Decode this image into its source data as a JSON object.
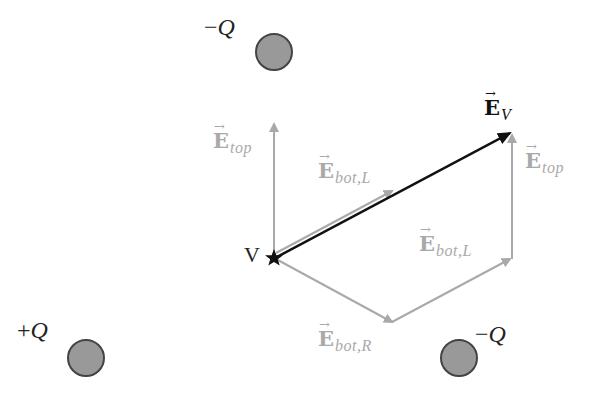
{
  "diagram": {
    "colors": {
      "charge_fill": "#999999",
      "charge_stroke": "#444444",
      "component_vector": "#a9a9a9",
      "net_vector": "#111111",
      "text": "#222222"
    },
    "charges": [
      {
        "id": "top",
        "sign": "−",
        "symbol": "Q",
        "x": 274,
        "y": 52
      },
      {
        "id": "bottom-left",
        "sign": "+",
        "symbol": "Q",
        "x": 86,
        "y": 358
      },
      {
        "id": "bottom-right",
        "sign": "−",
        "symbol": "Q",
        "x": 459,
        "y": 358
      }
    ],
    "point": {
      "label": "V",
      "x": 274,
      "y": 258
    },
    "vectors": {
      "e_top_at_v": {
        "base": "E",
        "arrow": "⃗",
        "arrow_glyph": "→",
        "sub": "top"
      },
      "e_bot_l_at_v": {
        "base": "E",
        "arrow_glyph": "→",
        "sub": "bot,L"
      },
      "e_bot_r": {
        "base": "E",
        "arrow_glyph": "→",
        "sub": "bot,R"
      },
      "e_bot_l_chain": {
        "base": "E",
        "arrow_glyph": "→",
        "sub": "bot,L"
      },
      "e_top_chain": {
        "base": "E",
        "arrow_glyph": "→",
        "sub": "top"
      },
      "e_v": {
        "base": "E",
        "arrow_glyph": "→",
        "sub": "V"
      }
    }
  }
}
